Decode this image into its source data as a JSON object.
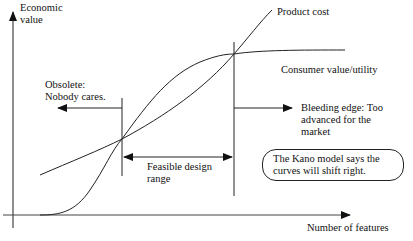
{
  "diagram": {
    "axes": {
      "y_label_line1": "Economic",
      "y_label_line2": "value",
      "x_label": "Number of features"
    },
    "curves": {
      "cost_label": "Product cost",
      "value_label": "Consumer value/utility"
    },
    "regions": {
      "obsolete_line1": "Obsolete:",
      "obsolete_line2": "Nobody cares.",
      "feasible_line1": "Feasible design",
      "feasible_line2": "range",
      "bleeding_line1": "Bleeding edge: Too",
      "bleeding_line2": "advanced for the",
      "bleeding_line3": "market"
    },
    "callout": {
      "line1": "The Kano model says the",
      "line2": "curves will shift right."
    },
    "colors": {
      "line": "#222222",
      "background": "#ffffff"
    }
  }
}
